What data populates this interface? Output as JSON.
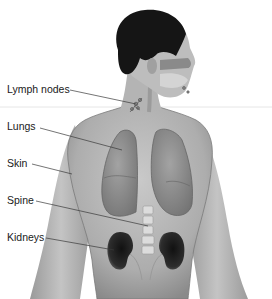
{
  "figure": {
    "labels": [
      {
        "id": "lymph-nodes",
        "text": "Lymph nodes",
        "x": 7,
        "y": 84
      },
      {
        "id": "lungs",
        "text": "Lungs",
        "x": 7,
        "y": 121
      },
      {
        "id": "skin",
        "text": "Skin",
        "x": 7,
        "y": 158
      },
      {
        "id": "spine",
        "text": "Spine",
        "x": 7,
        "y": 195
      },
      {
        "id": "kidneys",
        "text": "Kidneys",
        "x": 7,
        "y": 232
      }
    ],
    "colors": {
      "skin": "#b8b8b8",
      "skin_shadow": "#8e8e8e",
      "hair": "#151515",
      "lungs": "#8c8c8c",
      "kidneys": "#2a2a2a",
      "spine": "#d8d8d8",
      "leader_line": "#3a3a3a",
      "text": "#1a1a1a"
    }
  }
}
